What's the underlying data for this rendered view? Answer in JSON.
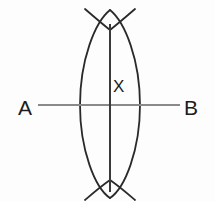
{
  "figure": {
    "width": 215,
    "height": 202,
    "background_color": "#fdfdfd"
  },
  "labels": {
    "endpoint_a": "A",
    "endpoint_b": "B",
    "midpoint_x": "X"
  },
  "colors": {
    "segment_line": "#8a8a8a",
    "bisector_line": "#3a3a3a",
    "arc_stroke": "#2a2a2a",
    "label_text": "#1c1c1c"
  },
  "geometry": {
    "segment_ab": {
      "name": "line-ab",
      "x1": 38,
      "y1": 105,
      "x2": 180,
      "y2": 105,
      "stroke_width": 2.2
    },
    "perpendicular_bisector": {
      "name": "line-bisector",
      "x1": 110,
      "y1": 24,
      "x2": 110,
      "y2": 192,
      "stroke_width": 2.0
    },
    "intersection_point": {
      "label": "X",
      "x": 110,
      "y": 105
    },
    "arc_crossing_top": {
      "x": 110,
      "y": 30
    },
    "arc_crossing_bottom": {
      "x": 110,
      "y": 180
    },
    "lens_half_width": 30,
    "arc_left": {
      "name": "arc-left",
      "path": "M 110 10 C 95 22 80 60 80 105 C 80 150 95 188 110 198",
      "stroke_width": 1.8
    },
    "arc_right": {
      "name": "arc-right",
      "path": "M 110 10 C 125 22 140 60 140 105 C 140 150 125 188 110 198",
      "stroke_width": 1.8
    },
    "arc_tail_top_left": {
      "name": "arc-tail-top-left",
      "path": "M 110 30 C 100 22 92 15 85 9"
    },
    "arc_tail_top_right": {
      "name": "arc-tail-top-right",
      "path": "M 110 30 C 120 22 128 15 135 9"
    },
    "arc_tail_bottom_left": {
      "name": "arc-tail-bottom-left",
      "path": "M 110 180 C 100 187 92 194 85 200"
    },
    "arc_tail_bottom_right": {
      "name": "arc-tail-bottom-right",
      "path": "M 110 180 C 120 187 128 194 135 200"
    }
  }
}
